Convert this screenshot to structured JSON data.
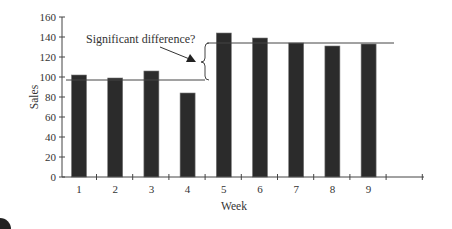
{
  "chart_data": {
    "type": "bar",
    "title": "",
    "xlabel": "Week",
    "ylabel": "Sales",
    "categories": [
      "1",
      "2",
      "3",
      "4",
      "5",
      "6",
      "7",
      "8",
      "9"
    ],
    "values": [
      102,
      99,
      106,
      84,
      144,
      139,
      134,
      131,
      133
    ],
    "ylim": [
      0,
      160
    ],
    "yticks": [
      0,
      20,
      40,
      60,
      80,
      100,
      120,
      140,
      160
    ],
    "grid": false,
    "legend": null,
    "annotations": [
      {
        "text": "Significant difference?",
        "type": "arrow-to-brace"
      },
      {
        "type": "hline",
        "y": 97,
        "span_weeks": "1-4"
      },
      {
        "type": "hline",
        "y": 135,
        "span_weeks": "5-9"
      }
    ],
    "bar_color": "#2b2b2b"
  },
  "labels": {
    "annotation": "Significant difference?",
    "xlabel": "Week",
    "ylabel": "Sales",
    "yticks": [
      "0",
      "20",
      "40",
      "60",
      "80",
      "100",
      "120",
      "140",
      "160"
    ],
    "xticks": [
      "1",
      "2",
      "3",
      "4",
      "5",
      "6",
      "7",
      "8",
      "9"
    ]
  }
}
